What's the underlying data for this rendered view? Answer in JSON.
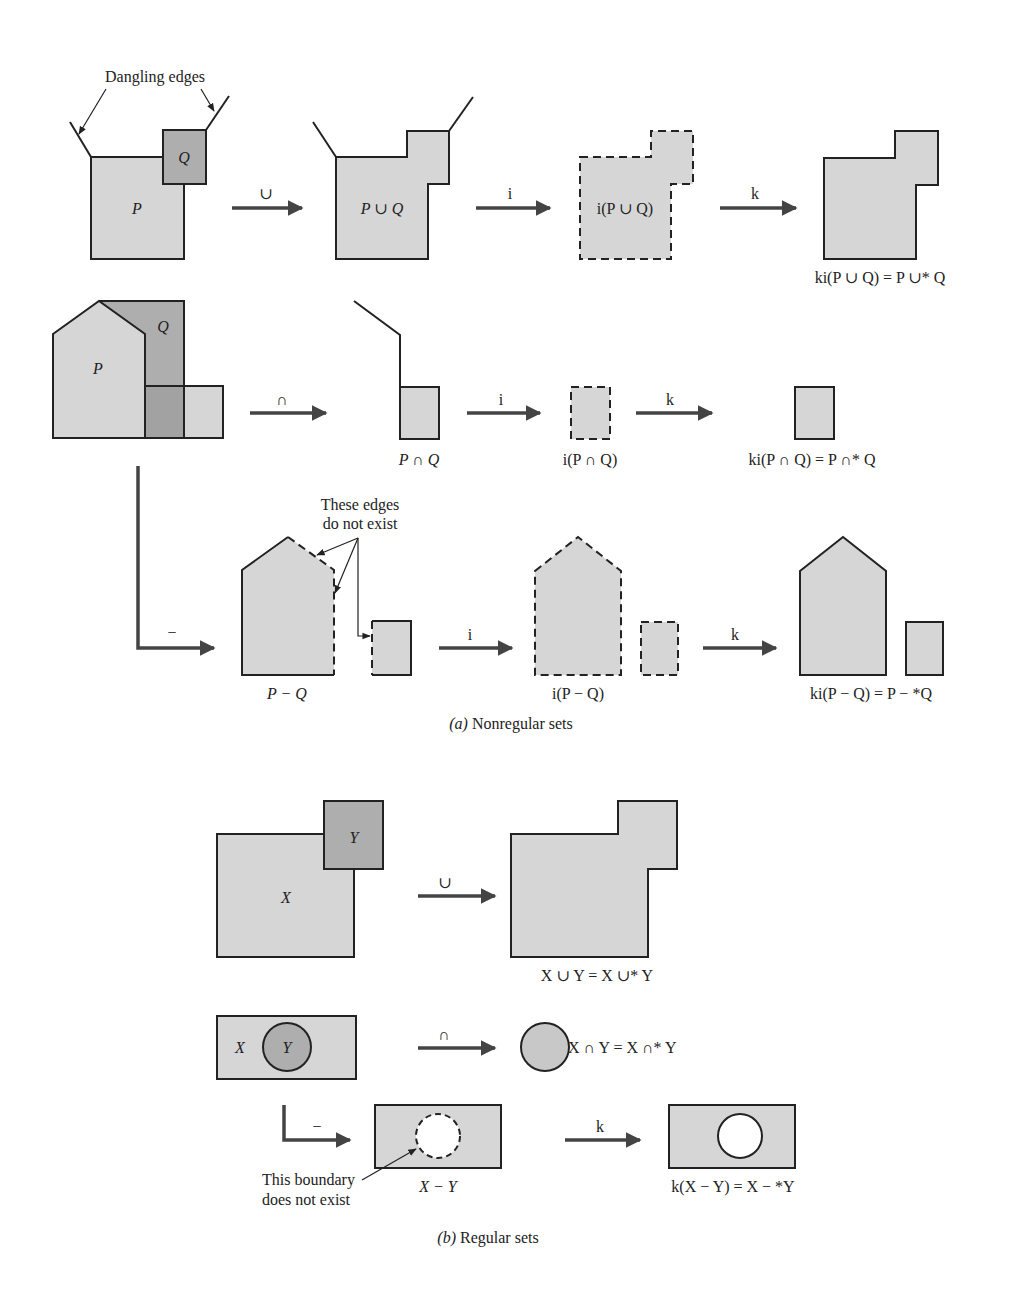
{
  "figure": {
    "part_a": {
      "caption_prefix": "(a)",
      "caption_text": " Nonregular sets",
      "annotations": {
        "dangling_edges": "Dangling edges",
        "these_edges_line1": "These edges",
        "these_edges_line2": "do not exist"
      },
      "row_union": {
        "input_labels": {
          "p": "P",
          "q": "Q"
        },
        "op1": "∪",
        "result1": "P ∪ Q",
        "op2": "i",
        "result2": "i(P ∪ Q)",
        "op3": "k",
        "result3": "ki(P ∪ Q) = P ∪* Q"
      },
      "row_intersection": {
        "input_labels": {
          "p": "P",
          "q": "Q"
        },
        "op1": "∩",
        "result1": "P ∩ Q",
        "op2": "i",
        "result2": "i(P ∩ Q)",
        "op3": "k",
        "result3": "ki(P ∩ Q) = P ∩* Q"
      },
      "row_difference": {
        "op1": "−",
        "result1": "P − Q",
        "op2": "i",
        "result2": "i(P − Q)",
        "op3": "k",
        "result3": "ki(P − Q) = P − *Q"
      }
    },
    "part_b": {
      "caption_prefix": "(b)",
      "caption_text": " Regular sets",
      "annotations": {
        "boundary_line1": "This boundary",
        "boundary_line2": "does not  exist"
      },
      "row_union": {
        "input_labels": {
          "x": "X",
          "y": "Y"
        },
        "op1": "∪",
        "result1": "X ∪ Y = X ∪* Y"
      },
      "row_intersection": {
        "input_labels": {
          "x": "X",
          "y": "Y"
        },
        "op1": "∩",
        "result1": "X ∩ Y = X ∩* Y"
      },
      "row_difference": {
        "op1": "−",
        "result1": "X − Y",
        "op2": "k",
        "result2": "k(X − Y) = X − *Y"
      }
    },
    "colors": {
      "fill_light": "#d6d6d6",
      "fill_dark": "#aeaeae",
      "stroke": "#222222",
      "arrow": "#444444",
      "background": "#ffffff"
    }
  }
}
